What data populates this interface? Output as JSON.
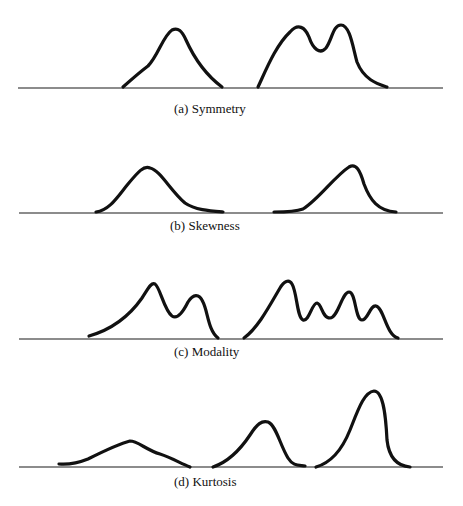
{
  "panels": [
    {
      "id": "a",
      "caption": "(a) Symmetry"
    },
    {
      "id": "b",
      "caption": "(b) Skewness"
    },
    {
      "id": "c",
      "caption": "(c) Modality"
    },
    {
      "id": "d",
      "caption": "(d) Kurtosis"
    }
  ]
}
